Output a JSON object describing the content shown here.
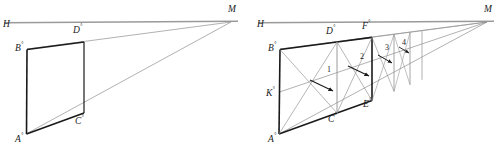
{
  "figure": {
    "type": "line-diagram",
    "width": 499,
    "height": 147,
    "background": "#ffffff",
    "stroke_dark": "#1a1a1a",
    "stroke_light": "#8a8a8a",
    "panels": [
      {
        "id": "left-panel",
        "name": "perspective-parallelogram",
        "horizon": {
          "label": "H",
          "y": 22,
          "x_start": 4,
          "x_end": 238
        },
        "vanishing_point": {
          "label": "M",
          "x": 231,
          "y": 22
        },
        "vertices": [
          {
            "label": "A",
            "sup": "°",
            "x": 22,
            "y": 137
          },
          {
            "label": "B",
            "sup": "°",
            "x": 23,
            "y": 53
          },
          {
            "label": "C",
            "sup": "°",
            "x": 80,
            "y": 114
          },
          {
            "label": "D",
            "sup": "°",
            "x": 80,
            "y": 41
          }
        ]
      },
      {
        "id": "right-panel",
        "name": "subdivided-perspective-grid",
        "horizon": {
          "label": "H",
          "y": 22,
          "x_start": 258,
          "x_end": 494
        },
        "vanishing_point": {
          "label": "M",
          "x": 487,
          "y": 22
        },
        "vertices": [
          {
            "label": "A",
            "sup": "°",
            "x": 275,
            "y": 137
          },
          {
            "label": "B",
            "sup": "°",
            "x": 276,
            "y": 53
          },
          {
            "label": "C",
            "sup": "°",
            "x": 333,
            "y": 114
          },
          {
            "label": "D",
            "sup": "°",
            "x": 333,
            "y": 41
          },
          {
            "label": "E",
            "sup": "°",
            "x": 368,
            "y": 96
          },
          {
            "label": "F",
            "sup": "°",
            "x": 368,
            "y": 36
          },
          {
            "label": "K",
            "sup": "°",
            "x": 276,
            "y": 96
          }
        ],
        "cell_numbers": [
          "1",
          "2",
          "3",
          "4"
        ]
      }
    ]
  },
  "labels": {
    "left": {
      "H": "H",
      "M": "M",
      "A": "A",
      "B": "B",
      "C": "C",
      "D": "D",
      "deg": "°"
    },
    "right": {
      "H": "H",
      "M": "M",
      "A": "A",
      "B": "B",
      "C": "C",
      "D": "D",
      "E": "E",
      "F": "F",
      "K": "K",
      "deg": "°",
      "n1": "1",
      "n2": "2",
      "n3": "3",
      "n4": "4"
    }
  }
}
